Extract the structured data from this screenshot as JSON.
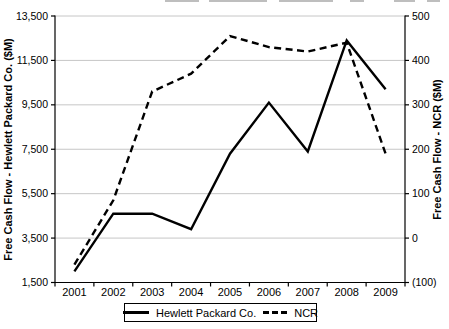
{
  "chart_data": {
    "type": "line",
    "x_categories": [
      "2001",
      "2002",
      "2003",
      "2004",
      "2005",
      "2006",
      "2007",
      "2008",
      "2009"
    ],
    "series": [
      {
        "name": "Hewlett Packard Co.",
        "axis": "left",
        "line_style": "solid",
        "color": "#000000",
        "values": [
          2000,
          4600,
          4600,
          3900,
          7300,
          9600,
          7400,
          12400,
          10200
        ]
      },
      {
        "name": "NCR",
        "axis": "right",
        "line_style": "dashed",
        "color": "#000000",
        "values": [
          -60,
          85,
          330,
          370,
          455,
          430,
          420,
          440,
          190
        ]
      }
    ],
    "left_axis": {
      "label": "Free Cash Flow - Hewlett Packard Co. ($M)",
      "min": 1500,
      "max": 13500,
      "tick_step": 2000,
      "tick_labels": [
        "1,500",
        "3,500",
        "5,500",
        "7,500",
        "9,500",
        "11,500",
        "13,500"
      ]
    },
    "right_axis": {
      "label": "Free Cash Flow - NCR ($M)",
      "min": -100,
      "max": 500,
      "tick_step": 100,
      "tick_labels": [
        "(100)",
        "0",
        "100",
        "200",
        "300",
        "400",
        "500"
      ]
    },
    "grid": {
      "horizontal": true,
      "vertical": false,
      "color": "#c6c6c6"
    },
    "axis_color": "#000000",
    "legend": {
      "position": "bottom-center"
    }
  }
}
